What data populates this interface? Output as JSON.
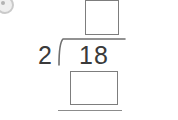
{
  "worksheet": {
    "type": "long-division",
    "title": "Long division problem",
    "divisor": "2",
    "dividend": "18",
    "operator_symbol": "long-division-bracket",
    "quotient_box": {
      "label": "quotient answer box",
      "value": "",
      "placeholder": ""
    },
    "remainder_box": {
      "label": "work / remainder answer box",
      "value": "",
      "placeholder": ""
    },
    "bottom_rule": {
      "label": "subtraction rule"
    },
    "watermark": {
      "label": "watermark-fragment"
    },
    "colors": {
      "ink": "#3a3a3a",
      "box_border": "#7d7d7d",
      "rule": "#8c8c8c",
      "background": "#ffffff"
    }
  }
}
